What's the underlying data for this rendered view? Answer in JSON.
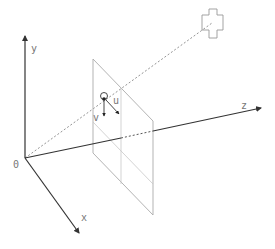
{
  "diagram": {
    "axes": {
      "origin_label": "0",
      "x_label": "x",
      "y_label": "y",
      "z_label": "z"
    },
    "image_plane": {
      "u_label": "u",
      "v_label": "v"
    },
    "colors": {
      "axis": "#333333",
      "plane": "#aaaaaa",
      "dotted_ray": "#888888",
      "label": "#777777"
    }
  }
}
